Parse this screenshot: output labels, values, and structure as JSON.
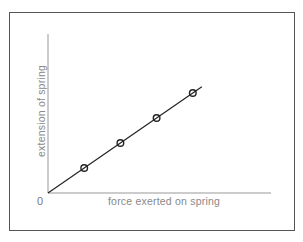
{
  "chart_data": {
    "type": "line",
    "title": "",
    "xlabel": "force exerted on spring",
    "ylabel": "extension of spring",
    "origin_label": "0",
    "x": [
      1,
      2,
      3,
      4
    ],
    "series": [
      {
        "name": "extension vs force",
        "values": [
          1,
          2,
          3,
          4
        ],
        "marker": "circle",
        "line": "best-fit through origin"
      }
    ],
    "fit_line": {
      "from": [
        0,
        0
      ],
      "to": [
        4.25,
        4.25
      ]
    },
    "xlim": [
      0,
      6.2
    ],
    "ylim": [
      0,
      6.4
    ],
    "grid": false,
    "legend": "none",
    "ticks": "none",
    "colors": {
      "line": "#222222",
      "axes": "#888888",
      "text": "#888888",
      "frame": "#555555"
    }
  }
}
